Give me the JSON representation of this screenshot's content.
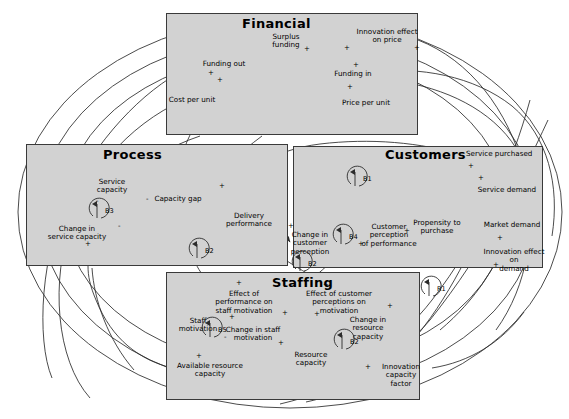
{
  "diagram": {
    "type": "causal-loop-diagram",
    "background_color": "#ffffff",
    "box_fill_color": "#d2d2d2",
    "box_border_color": "#3a3a3a",
    "line_color": "#2b2b2b"
  },
  "subsystems": [
    {
      "id": "financial",
      "title": "Financial",
      "x": 166,
      "y": 13,
      "w": 252,
      "h": 122,
      "title_x": 242,
      "title_y": 16,
      "variables": [
        {
          "name": "Surplus funding",
          "x": 258,
          "y": 33,
          "w": 56,
          "lines": [
            "Surplus",
            "funding"
          ]
        },
        {
          "name": "Funding out",
          "x": 198,
          "y": 60,
          "w": 52,
          "lines": [
            "Funding out"
          ]
        },
        {
          "name": "Cost per unit",
          "x": 164,
          "y": 96,
          "w": 56,
          "lines": [
            "Cost per unit"
          ]
        },
        {
          "name": "Funding in",
          "x": 330,
          "y": 70,
          "w": 46,
          "lines": [
            "Funding in"
          ]
        },
        {
          "name": "Price per unit",
          "x": 337,
          "y": 99,
          "w": 58,
          "lines": [
            "Price per unit"
          ]
        },
        {
          "name": "Innovation effect on price",
          "x": 355,
          "y": 28,
          "w": 64,
          "lines": [
            "Innovation effect",
            "on price"
          ]
        }
      ]
    },
    {
      "id": "process",
      "title": "Process",
      "x": 26,
      "y": 144,
      "w": 262,
      "h": 122,
      "title_x": 103,
      "title_y": 147,
      "variables": [
        {
          "name": "Service capacity",
          "x": 88,
          "y": 178,
          "w": 48,
          "lines": [
            "Service",
            "capacity"
          ]
        },
        {
          "name": "Capacity gap",
          "x": 152,
          "y": 195,
          "w": 52,
          "lines": [
            "Capacity gap"
          ]
        },
        {
          "name": "Delivery performance",
          "x": 222,
          "y": 212,
          "w": 54,
          "lines": [
            "Delivery",
            "performance"
          ]
        },
        {
          "name": "Change in service capacity",
          "x": 40,
          "y": 225,
          "w": 74,
          "lines": [
            "Change in",
            "service capacity"
          ]
        }
      ]
    },
    {
      "id": "customers",
      "title": "Customers",
      "x": 293,
      "y": 146,
      "w": 250,
      "h": 122,
      "title_x": 385,
      "title_y": 147,
      "variables": [
        {
          "name": "Service purchased",
          "x": 466,
          "y": 150,
          "w": 66,
          "lines": [
            "Service purchased"
          ]
        },
        {
          "name": "Service demand",
          "x": 477,
          "y": 186,
          "w": 60,
          "lines": [
            "Service demand"
          ]
        },
        {
          "name": "Market demand",
          "x": 483,
          "y": 221,
          "w": 58,
          "lines": [
            "Market demand"
          ]
        },
        {
          "name": "Innovation effect on demand",
          "x": 478,
          "y": 248,
          "w": 72,
          "lines": [
            "Innovation effect on",
            "demand"
          ]
        },
        {
          "name": "Propensity to purchase",
          "x": 410,
          "y": 219,
          "w": 54,
          "lines": [
            "Propensity to",
            "purchase"
          ]
        },
        {
          "name": "Customer perception of performance",
          "x": 360,
          "y": 223,
          "w": 58,
          "lines": [
            "Customer",
            "perception",
            "of performance"
          ]
        },
        {
          "name": "Change in customer perception",
          "x": 286,
          "y": 231,
          "w": 48,
          "lines": [
            "Change in",
            "customer",
            "perception"
          ]
        }
      ]
    },
    {
      "id": "staffing",
      "title": "Staffing",
      "x": 166,
      "y": 272,
      "w": 254,
      "h": 128,
      "title_x": 272,
      "title_y": 275,
      "variables": [
        {
          "name": "Effect of performance on staff motivation",
          "x": 205,
          "y": 290,
          "w": 78,
          "lines": [
            "Effect of performance on",
            "staff motivation"
          ]
        },
        {
          "name": "Effect of customer perceptions on motivation",
          "x": 300,
          "y": 290,
          "w": 78,
          "lines": [
            "Effect of customer",
            "perceptions on motivation"
          ]
        },
        {
          "name": "Staff motivation",
          "x": 176,
          "y": 317,
          "w": 44,
          "lines": [
            "Staff",
            "motivation"
          ]
        },
        {
          "name": "Change in staff motivation",
          "x": 222,
          "y": 326,
          "w": 62,
          "lines": [
            "Change in staff",
            "motivation"
          ]
        },
        {
          "name": "Change in resource capacity",
          "x": 335,
          "y": 316,
          "w": 66,
          "lines": [
            "Change in resource",
            "capacity"
          ]
        },
        {
          "name": "Resource capacity",
          "x": 288,
          "y": 351,
          "w": 46,
          "lines": [
            "Resource",
            "capacity"
          ]
        },
        {
          "name": "Available resource capacity",
          "x": 172,
          "y": 362,
          "w": 76,
          "lines": [
            "Available resource",
            "capacity"
          ]
        },
        {
          "name": "Innovation capacity factor",
          "x": 368,
          "y": 363,
          "w": 66,
          "lines": [
            "Innovation capacity",
            "factor"
          ]
        }
      ]
    }
  ],
  "loops": [
    {
      "id": "B1",
      "label": "B1",
      "cx": 358,
      "cy": 178,
      "lx": 363,
      "ly": 175
    },
    {
      "id": "B2_process",
      "label": "B2",
      "cx": 200,
      "cy": 250,
      "lx": 205,
      "ly": 247
    },
    {
      "id": "B3",
      "label": "B3",
      "cx": 100,
      "cy": 210,
      "lx": 105,
      "ly": 207
    },
    {
      "id": "B4",
      "label": "B4",
      "cx": 344,
      "cy": 236,
      "lx": 349,
      "ly": 233
    },
    {
      "id": "R3",
      "label": "B2",
      "cx": 303,
      "cy": 263,
      "lx": 308,
      "ly": 260
    },
    {
      "id": "B5",
      "label": "B5",
      "cx": 213,
      "cy": 329,
      "lx": 218,
      "ly": 326
    },
    {
      "id": "B2_staffing",
      "label": "B2",
      "cx": 345,
      "cy": 341,
      "lx": 350,
      "ly": 338
    },
    {
      "id": "R1",
      "label": "R1",
      "cx": 432,
      "cy": 288,
      "lx": 437,
      "ly": 285
    }
  ],
  "polarities": [
    {
      "sign": "+",
      "x": 304,
      "y": 46
    },
    {
      "sign": "+",
      "x": 344,
      "y": 45
    },
    {
      "sign": "+",
      "x": 208,
      "y": 70
    },
    {
      "sign": "+",
      "x": 217,
      "y": 77
    },
    {
      "sign": "+",
      "x": 353,
      "y": 62
    },
    {
      "sign": "+",
      "x": 347,
      "y": 84
    },
    {
      "sign": "+",
      "x": 414,
      "y": 45
    },
    {
      "sign": "-",
      "x": 146,
      "y": 196
    },
    {
      "sign": "+",
      "x": 219,
      "y": 183
    },
    {
      "sign": "-",
      "x": 96,
      "y": 198
    },
    {
      "sign": "-",
      "x": 118,
      "y": 223
    },
    {
      "sign": "+",
      "x": 85,
      "y": 241
    },
    {
      "sign": "+",
      "x": 288,
      "y": 223
    },
    {
      "sign": "+",
      "x": 358,
      "y": 241
    },
    {
      "sign": "+",
      "x": 404,
      "y": 228
    },
    {
      "sign": "+",
      "x": 468,
      "y": 163
    },
    {
      "sign": "+",
      "x": 478,
      "y": 175
    },
    {
      "sign": "+",
      "x": 497,
      "y": 235
    },
    {
      "sign": "+",
      "x": 493,
      "y": 262
    },
    {
      "sign": "+",
      "x": 229,
      "y": 314
    },
    {
      "sign": "+",
      "x": 282,
      "y": 310
    },
    {
      "sign": "+",
      "x": 314,
      "y": 311
    },
    {
      "sign": "+",
      "x": 387,
      "y": 303
    },
    {
      "sign": "-",
      "x": 224,
      "y": 334
    },
    {
      "sign": "+",
      "x": 196,
      "y": 353
    },
    {
      "sign": "+",
      "x": 278,
      "y": 340
    },
    {
      "sign": "+",
      "x": 365,
      "y": 364
    },
    {
      "sign": "+",
      "x": 236,
      "y": 280
    },
    {
      "sign": "+",
      "x": 323,
      "y": 282
    }
  ]
}
